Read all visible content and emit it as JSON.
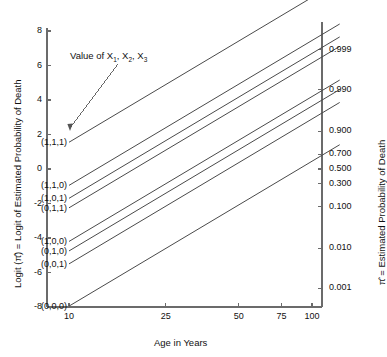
{
  "chart_data": {
    "type": "line",
    "title": "",
    "xlabel": "Age in Years",
    "ylabel": "Logit (π̂) = Logit of Estimated Probability of Death",
    "ylabel_right": "π̂ = Estimated Probability of Death",
    "xscale": "log",
    "xlim": [
      7,
      105
    ],
    "ylim": [
      -8,
      8
    ],
    "grid": false,
    "legend": "inline-line-labels",
    "annotation": "Value of X₁, X₂, X₃",
    "annotation_parts": {
      "lead": "Value of X",
      "s1": "1",
      "mid1": ", X",
      "s2": "2",
      "mid2": ", X",
      "s3": "3"
    },
    "xticks": [
      10,
      25,
      50,
      75,
      100
    ],
    "xticklabels": [
      "10",
      "25",
      "50",
      "75",
      "100"
    ],
    "yticks": [
      -8,
      -6,
      -4,
      -2,
      0,
      2,
      4,
      6,
      8
    ],
    "yticklabels": [
      "-8",
      "-6",
      "-4",
      "-2",
      "0",
      "2",
      "4",
      "6",
      "8"
    ],
    "right_axis": {
      "values": [
        0.001,
        0.01,
        0.1,
        0.3,
        0.5,
        0.7,
        0.9,
        0.99,
        0.999
      ],
      "labels": [
        "0.001",
        "0.010",
        "0.100",
        "0.300",
        "0.500",
        "0.700",
        "0.900",
        "0.990",
        "0.999"
      ],
      "logits": [
        -6.907,
        -4.595,
        -2.197,
        -0.847,
        0.0,
        0.847,
        2.197,
        4.595,
        6.907
      ]
    },
    "series": [
      {
        "name": "(1,1,1)",
        "label": "(1,1,1)",
        "intercept_at_age10": 1.55,
        "value_at_age100": 9.95
      },
      {
        "name": "(1,1,0)",
        "label": "(1,1,0)",
        "intercept_at_age10": -0.95,
        "value_at_age100": 7.45
      },
      {
        "name": "(1,0,1)",
        "label": "(1,0,1)",
        "intercept_at_age10": -1.7,
        "value_at_age100": 6.7
      },
      {
        "name": "(0,1,1)",
        "label": "(0,1,1)",
        "intercept_at_age10": -2.25,
        "value_at_age100": 6.15
      },
      {
        "name": "(1,0,0)",
        "label": "(1,0,0)",
        "intercept_at_age10": -4.2,
        "value_at_age100": 4.2
      },
      {
        "name": "(0,1,0)",
        "label": "(0,1,0)",
        "intercept_at_age10": -4.75,
        "value_at_age100": 3.65
      },
      {
        "name": "(0,0,1)",
        "label": "(0,0,1)",
        "intercept_at_age10": -5.5,
        "value_at_age100": 2.9
      },
      {
        "name": "(0,0,0)",
        "label": "(0,0,0)",
        "intercept_at_age10": -7.95,
        "value_at_age100": 0.45
      }
    ],
    "line_color": "#4a4a4a",
    "axis_color": "#6b6b6b"
  }
}
